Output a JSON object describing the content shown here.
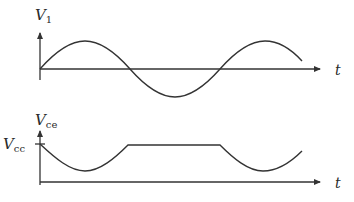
{
  "diagram": {
    "top_plot": {
      "y_label": {
        "main": "V",
        "sub": "1"
      },
      "x_label": "t",
      "description": "Sinusoidal input voltage V1 vs time, starting at zero, about 1.7 cycles"
    },
    "bottom_plot": {
      "y_label": {
        "main": "V",
        "sub": "ce"
      },
      "y_tick_label": {
        "main": "V",
        "sub": "cc"
      },
      "x_label": "t",
      "description": "Collector-emitter voltage Vce: starts at Vcc, dips to a minimum, rises and clips flat at Vcc while V1 is negative, then dips again"
    },
    "colors": {
      "line": "#333333",
      "background": "#ffffff"
    }
  }
}
